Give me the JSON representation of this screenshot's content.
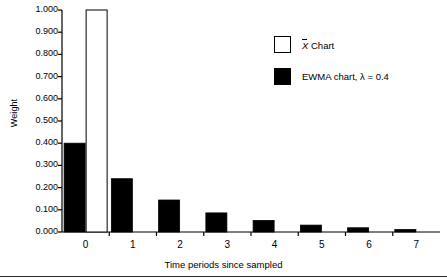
{
  "chart_data": {
    "type": "bar",
    "title": "",
    "subtitle": "",
    "xlabel": "Time periods since sampled",
    "ylabel": "Weight",
    "categories": [
      "0",
      "1",
      "2",
      "3",
      "4",
      "5",
      "6",
      "7"
    ],
    "x": [
      0,
      1,
      2,
      3,
      4,
      5,
      6,
      7
    ],
    "ylim": [
      0.0,
      1.0
    ],
    "xlim": [
      -0.5,
      7.5
    ],
    "grid": false,
    "legend_position": "upper-right-inside",
    "ytick_labels": [
      "0.000",
      "0.100",
      "0.200",
      "0.300",
      "0.400",
      "0.500",
      "0.600",
      "0.700",
      "0.800",
      "0.900",
      "1.000"
    ],
    "ytick_values": [
      0.0,
      0.1,
      0.2,
      0.3,
      0.4,
      0.5,
      0.6,
      0.7,
      0.8,
      0.9,
      1.0
    ],
    "series": [
      {
        "name": "X̄ Chart",
        "legend_label_prefix": "X",
        "legend_label_suffix": " Chart",
        "fill": "#ffffff",
        "stroke": "#000000",
        "values": [
          1.0,
          0.0,
          0.0,
          0.0,
          0.0,
          0.0,
          0.0,
          0.0
        ]
      },
      {
        "name": "EWMA chart, λ = 0.4",
        "legend_label": "EWMA chart, λ = 0.4",
        "fill": "#000000",
        "stroke": "#000000",
        "values": [
          0.4,
          0.24,
          0.144,
          0.086,
          0.052,
          0.031,
          0.019,
          0.011
        ]
      }
    ]
  },
  "axes": {
    "y_label": "Weight",
    "x_label": "Time periods since sampled"
  },
  "legend": {
    "items": [
      {
        "label_prefix": "X",
        "label_suffix": " Chart",
        "swatch": "white"
      },
      {
        "label": "EWMA chart, λ = 0.4",
        "swatch": "black"
      }
    ]
  },
  "colors": {
    "ink": "#000000",
    "background": "#ffffff",
    "rule": "#2b2b2b"
  }
}
